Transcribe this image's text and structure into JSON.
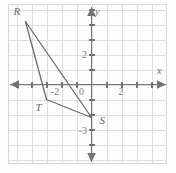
{
  "figure": {
    "type": "coordinate-plane-triangle",
    "background_color": "#fdfdfd",
    "border_color": "#d8d8d8",
    "grid_color": "#dcdcdc",
    "axis_color": "#737373",
    "shape_color": "#6b6b6b",
    "text_color": "#6a6a6a"
  },
  "axes": {
    "x_axis_label": "x",
    "y_axis_label": "y",
    "origin_label": "0",
    "x_ticks": [
      {
        "label": "-2",
        "value": -2
      },
      {
        "label": "2",
        "value": 2
      }
    ],
    "y_ticks": [
      {
        "label": "2",
        "value": 2
      },
      {
        "label": "-3",
        "value": -3
      }
    ],
    "x_range": [
      -5.8,
      5.5
    ],
    "y_range": [
      -5.5,
      5.9
    ],
    "grid_step": 1
  },
  "chart_data": {
    "type": "scatter",
    "title": "",
    "xlabel": "x",
    "ylabel": "y",
    "xlim": [
      -5.8,
      5.5
    ],
    "ylim": [
      -5.5,
      5.9
    ],
    "grid": true,
    "legend": "none",
    "series": [
      {
        "name": "Triangle RTS",
        "points": [
          {
            "label": "R",
            "x": -4.4,
            "y": 4.2
          },
          {
            "label": "T",
            "x": -3.0,
            "y": -1.0
          },
          {
            "label": "S",
            "x": 0.0,
            "y": -2.2
          }
        ],
        "closed": true
      }
    ]
  },
  "vertices": [
    {
      "name": "R",
      "label": "R",
      "label_dx": -12,
      "label_dy": -7
    },
    {
      "name": "T",
      "label": "T",
      "label_dx": -11,
      "label_dy": 11
    },
    {
      "name": "S",
      "label": "S",
      "label_dx": 8,
      "label_dy": 6
    }
  ]
}
